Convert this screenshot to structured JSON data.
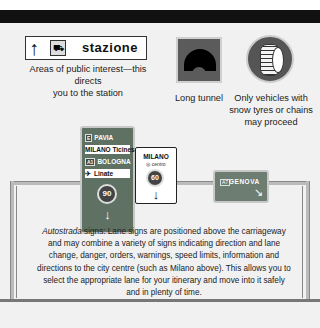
{
  "signs": {
    "station": {
      "arrow": "↑",
      "icon": "train-icon",
      "icon_glyph": "🚆",
      "label": "stazione",
      "caption_line1": "Areas of public interest—this directs",
      "caption_line2": "you to the station"
    },
    "tunnel": {
      "icon": "tunnel-icon",
      "caption": "Long tunnel"
    },
    "snow": {
      "icon": "snow-tyre-icon",
      "caption_line1": "Only vehicles with",
      "caption_line2": "snow tyres or chains",
      "caption_line3": "may proceed"
    },
    "lane_green": {
      "rows": [
        {
          "badge": "E",
          "text": "PAVIA"
        },
        {
          "badge": "",
          "text": "MILANO Ticinese"
        },
        {
          "badge": "A1",
          "text": "BOLOGNA"
        },
        {
          "badge": "✈",
          "text": "Linate"
        }
      ],
      "speed": "90",
      "arrow": "↓"
    },
    "lane_milano": {
      "name": "MILANO",
      "sub": "◎ centro",
      "speed": "60",
      "arrow": "↓"
    },
    "lane_genova": {
      "badge": "A7",
      "name": "GENOVA",
      "arrow": "↘"
    }
  },
  "description": {
    "italic_word": "Autostrada",
    "text": " signs: Lane signs are positioned above the carriageway and may combine a variety of signs indicating direction and lane change, danger, orders, warnings, speed limits, information and directions to the city centre (such as Milano above). This allows you to select the appropriate lane for your itinerary and move into it safely and in plenty of time."
  },
  "colors": {
    "sign_green": "#5e7162",
    "sign_green_light": "#6e7d72",
    "top_bar": "#111111",
    "panel_bg": "#f1f1f1"
  }
}
